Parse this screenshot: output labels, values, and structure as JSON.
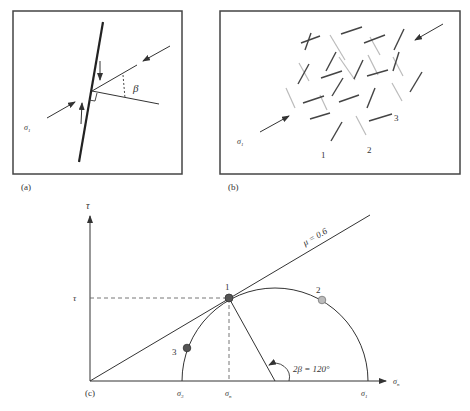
{
  "panel_a": {
    "label": "(a)",
    "sigma_label": "σ",
    "sigma_sub": "1",
    "angle_label": "β"
  },
  "panel_b": {
    "label": "(b)",
    "sigma_label": "σ",
    "sigma_sub": "1",
    "fracture_labels": [
      "1",
      "2",
      "3"
    ]
  },
  "panel_c": {
    "label": "(c)",
    "y_axis_label": "τ",
    "tau_tick": "τ",
    "x_axis_label": "σ",
    "x_axis_sub": "n",
    "sigma3": "σ",
    "sigma3_sub": "3",
    "sigman": "σ",
    "sigman_sub": "n",
    "sigma1": "σ",
    "sigma1_sub": "1",
    "friction_label": "μ = 0.6",
    "angle_label": "2β = 120°",
    "points": [
      {
        "label": "1",
        "color": "#555555"
      },
      {
        "label": "2",
        "color": "#bbbbbb"
      },
      {
        "label": "3",
        "color": "#555555"
      }
    ]
  }
}
